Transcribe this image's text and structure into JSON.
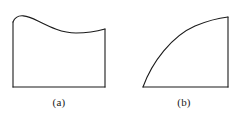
{
  "figure": {
    "background_color": "#ffffff",
    "stroke_color": "#1a1a1a",
    "stroke_width": 1.1,
    "width": 240,
    "height": 124,
    "panels": [
      {
        "id": "a",
        "caption": "(a)",
        "description": "Region bounded above by a wavy curve with a crest near the left and a shallow trough near the right, below by a horizontal baseline, and on the left and right by vertical segments.",
        "baseline_y": 87,
        "left_x": 13,
        "right_x": 105,
        "curve_kind": "wavy",
        "curve_path": "M 13 22 C 17 12, 28 16, 38 21 C 50 27, 62 33, 76 33 C 88 33, 98 31, 105 29",
        "left_edge_path": "M 13 22 L 13 87",
        "right_edge_path": "M 105 29 L 105 87",
        "baseline_path": "M 13 87 L 105 87",
        "curve_points": [
          {
            "x": 13,
            "y": 22
          },
          {
            "x": 22,
            "y": 18
          },
          {
            "x": 32,
            "y": 19
          },
          {
            "x": 45,
            "y": 24
          },
          {
            "x": 58,
            "y": 29
          },
          {
            "x": 72,
            "y": 33
          },
          {
            "x": 85,
            "y": 33
          },
          {
            "x": 96,
            "y": 31
          },
          {
            "x": 105,
            "y": 29
          }
        ]
      },
      {
        "id": "b",
        "caption": "(b)",
        "description": "Region bounded above by a concave-down increasing curve rising from the bottom-left corner to the top-right, below by a horizontal baseline, and on the right by a vertical segment.",
        "baseline_y": 87,
        "left_x": 143,
        "right_x": 228,
        "curve_kind": "concave-down-increasing",
        "curve_path": "M 143 87 C 152 62, 172 36, 195 26 C 207 21, 219 18, 228 17",
        "right_edge_path": "M 228 17 L 228 87",
        "baseline_path": "M 143 87 L 228 87",
        "curve_points": [
          {
            "x": 143,
            "y": 87
          },
          {
            "x": 151,
            "y": 68
          },
          {
            "x": 161,
            "y": 54
          },
          {
            "x": 173,
            "y": 41
          },
          {
            "x": 186,
            "y": 31
          },
          {
            "x": 200,
            "y": 24
          },
          {
            "x": 214,
            "y": 19
          },
          {
            "x": 228,
            "y": 17
          }
        ]
      }
    ]
  }
}
